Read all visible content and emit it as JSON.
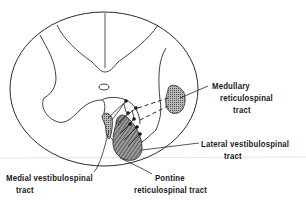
{
  "diagram": {
    "colors": {
      "line": "#2a2a2a",
      "tract_fill": "#8a8a8a",
      "background": "#ffffff"
    },
    "labels": {
      "medullary": {
        "line1": "Medullary",
        "line2": "reticulospinal",
        "line3": "tract"
      },
      "lateral": {
        "line1": "Lateral vestibulospinal",
        "line2": "tract"
      },
      "medial": {
        "line1": "Medial vestibulospinal",
        "line2": "tract"
      },
      "pontine": {
        "line1": "Pontine",
        "line2": "reticulospinal tract"
      }
    }
  }
}
